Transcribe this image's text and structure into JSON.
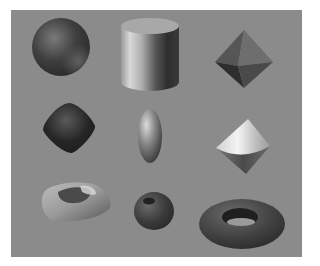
{
  "scene": {
    "description": "Nine shaded 3D geometric solids on a gray background",
    "background_color": "#8b8b8b",
    "page_color": "#ffffff",
    "objects": [
      {
        "name": "sphere",
        "row": 1,
        "col": 1
      },
      {
        "name": "cylinder",
        "row": 1,
        "col": 2
      },
      {
        "name": "octahedron",
        "row": 1,
        "col": 3
      },
      {
        "name": "rounded-cube",
        "row": 2,
        "col": 1
      },
      {
        "name": "ellipsoid",
        "row": 2,
        "col": 2
      },
      {
        "name": "double-cone",
        "row": 2,
        "col": 3
      },
      {
        "name": "rounded-square-torus",
        "row": 3,
        "col": 1
      },
      {
        "name": "apple-torus",
        "row": 3,
        "col": 2
      },
      {
        "name": "torus",
        "row": 3,
        "col": 3
      }
    ]
  }
}
